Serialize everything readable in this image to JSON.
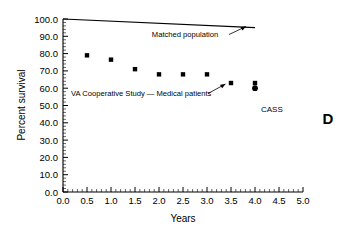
{
  "panel": {
    "letter": "D"
  },
  "chart_data": {
    "type": "scatter",
    "title": "",
    "xlabel": "Years",
    "ylabel": "Percent survival",
    "xlim": [
      0.0,
      5.0
    ],
    "ylim": [
      0.0,
      100.0
    ],
    "xticks": [
      "0.0",
      "0.5",
      "1.0",
      "1.5",
      "2.0",
      "2.5",
      "3.0",
      "3.5",
      "4.0",
      "4.5",
      "5.0"
    ],
    "xtick_values": [
      0.0,
      0.5,
      1.0,
      1.5,
      2.0,
      2.5,
      3.0,
      3.5,
      4.0,
      4.5,
      5.0
    ],
    "yticks": [
      "0.0",
      "10.0",
      "20.0",
      "30.0",
      "40.0",
      "50.0",
      "60.0",
      "70.0",
      "80.0",
      "90.0",
      "100.0"
    ],
    "ytick_values": [
      0,
      10,
      20,
      30,
      40,
      50,
      60,
      70,
      80,
      90,
      100
    ],
    "grid": false,
    "legend_position": "inline-annotations",
    "series": [
      {
        "name": "Matched population",
        "type": "line",
        "marker": "none",
        "x": [
          0.0,
          4.0
        ],
        "values": [
          100.0,
          95.0
        ]
      },
      {
        "name": "VA Cooperative Study — Medical patients",
        "type": "scatter",
        "marker": "square",
        "x": [
          0.5,
          1.0,
          1.5,
          2.0,
          2.5,
          3.0,
          3.5
        ],
        "values": [
          79.0,
          76.5,
          71.0,
          68.0,
          68.0,
          68.0,
          63.0
        ]
      },
      {
        "name": "CASS",
        "type": "scatter",
        "marker": "square+circle",
        "x": [
          4.0,
          4.0
        ],
        "values": [
          63.0,
          60.0
        ]
      }
    ],
    "annotations": [
      {
        "text": "Matched population",
        "x": 2.55,
        "y": 87.5,
        "points_to_x": 3.9,
        "points_to_y": 95.3
      },
      {
        "text": "VA Cooperative Study — Medical patients",
        "x": 0.35,
        "y": 57.5,
        "points_to_x": 3.47,
        "points_to_y": 62.2
      }
    ],
    "legend_entries": [
      {
        "label": "CASS",
        "marker": "square-over-circle"
      }
    ]
  }
}
